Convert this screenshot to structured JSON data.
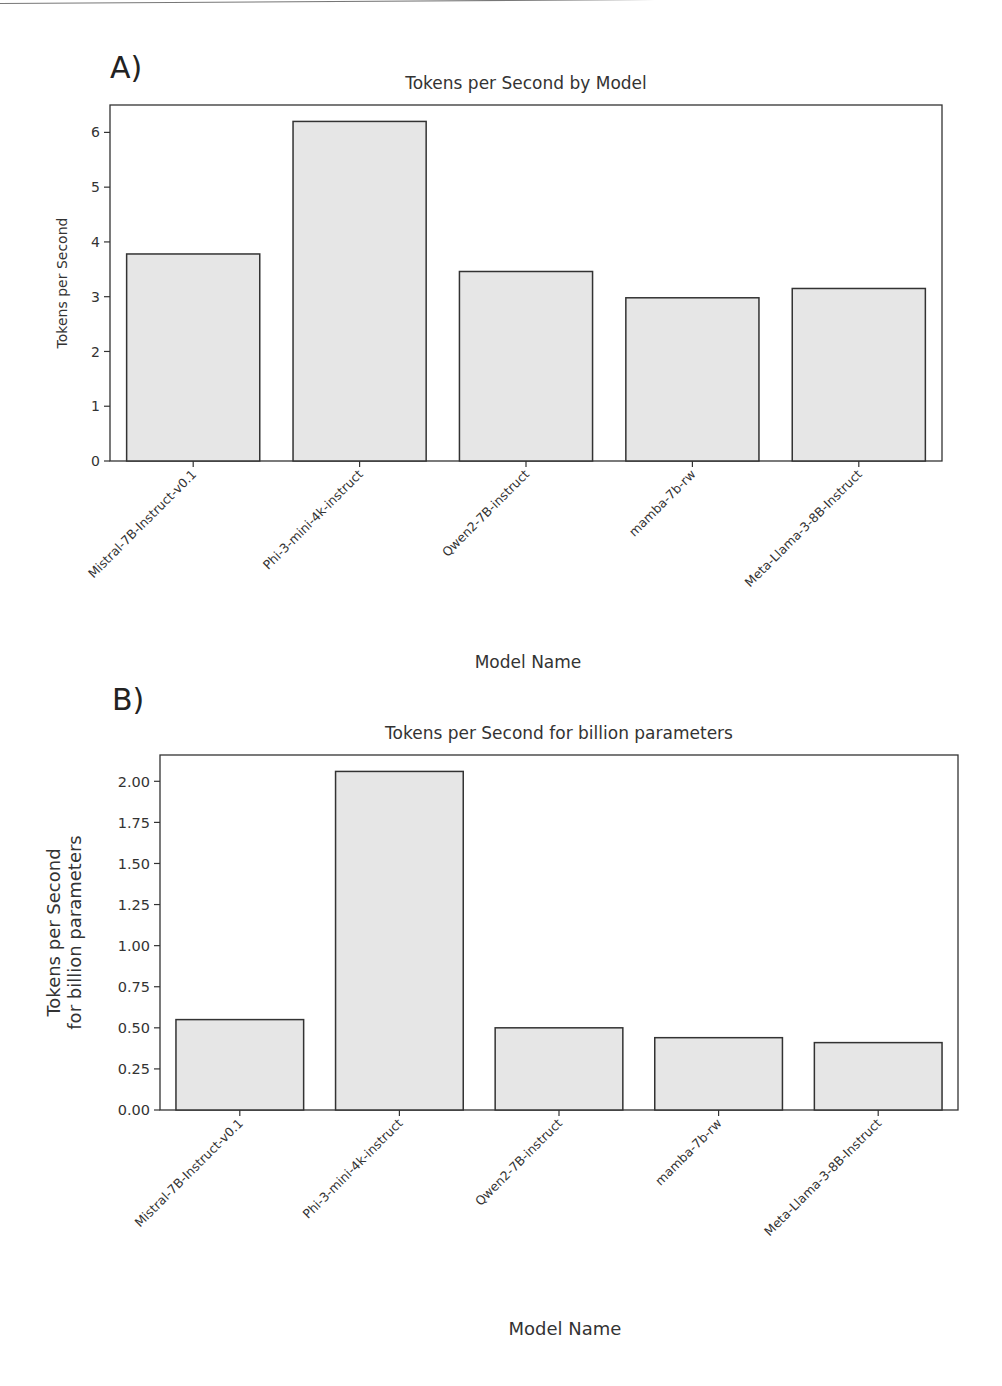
{
  "figure": {
    "panels": [
      {
        "letter": "A)"
      },
      {
        "letter": "B)"
      }
    ]
  },
  "chart_data": [
    {
      "type": "bar",
      "panel": "A)",
      "title": "Tokens per Second by Model",
      "xlabel": "Model Name",
      "ylabel": "Tokens per Second",
      "categories": [
        "Mistral-7B-Instruct-v0.1",
        "Phi-3-mini-4k-instruct",
        "Qwen2-7B-instruct",
        "mamba-7b-rw",
        "Meta-Llama-3-8B-Instruct"
      ],
      "values": [
        3.78,
        6.2,
        3.46,
        2.98,
        3.15
      ],
      "yticks": [
        "0",
        "1",
        "2",
        "3",
        "4",
        "5",
        "6"
      ],
      "ylim": [
        0,
        6.5
      ],
      "grid": false,
      "bar_color": "#e6e6e6",
      "edge_color": "#333333"
    },
    {
      "type": "bar",
      "panel": "B)",
      "title": "Tokens per Second for billion parameters",
      "xlabel": "Model Name",
      "ylabel": [
        "Tokens per Second",
        "for billion parameters"
      ],
      "categories": [
        "Mistral-7B-Instruct-v0.1",
        "Phi-3-mini-4k-instruct",
        "Qwen2-7B-instruct",
        "mamba-7b-rw",
        "Meta-Llama-3-8B-Instruct"
      ],
      "values": [
        0.55,
        2.06,
        0.5,
        0.44,
        0.41
      ],
      "yticks": [
        "0.00",
        "0.25",
        "0.50",
        "0.75",
        "1.00",
        "1.25",
        "1.50",
        "1.75",
        "2.00"
      ],
      "ylim": [
        0,
        2.16
      ],
      "grid": false,
      "bar_color": "#e6e6e6",
      "edge_color": "#333333"
    }
  ]
}
